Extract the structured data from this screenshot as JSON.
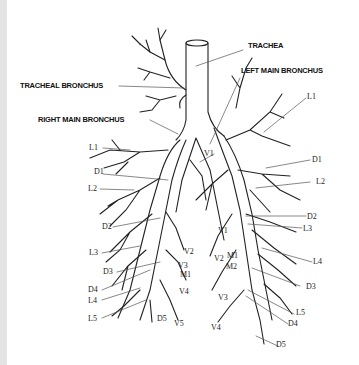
{
  "diagram": {
    "type": "anatomical-line-drawing",
    "main_labels": {
      "trachea": "TRACHEA",
      "tracheal_bronchus": "TRACHEAL BRONCHUS",
      "right_main_bronchus": "RIGHT MAIN BRONCHUS",
      "left_main_bronchus": "LEFT MAIN BRONCHUS"
    },
    "right_side_labels": {
      "L1": "L1",
      "D1": "D1",
      "L2": "L2",
      "D2": "D2",
      "L3": "L3",
      "D3": "D3",
      "D4": "D4",
      "L4": "L4",
      "L5": "L5",
      "D5": "D5",
      "V1": "V1",
      "V2": "V2",
      "V3": "V3",
      "V4": "V4",
      "V5": "V5",
      "M1": "M1"
    },
    "left_side_labels": {
      "L1": "L1",
      "D1": "D1",
      "L2": "L2",
      "D2": "D2",
      "L3": "L3",
      "L4": "L4",
      "D3": "D3",
      "L5": "L5",
      "D4": "D4",
      "D5": "D5",
      "V1a": "V1",
      "V1b": "V1",
      "V2": "V2",
      "M1": "M1",
      "M2": "M2",
      "V3": "V3",
      "V4": "V4"
    },
    "colors": {
      "line": "#222222",
      "leader": "#555555",
      "background": "#ffffff"
    }
  }
}
